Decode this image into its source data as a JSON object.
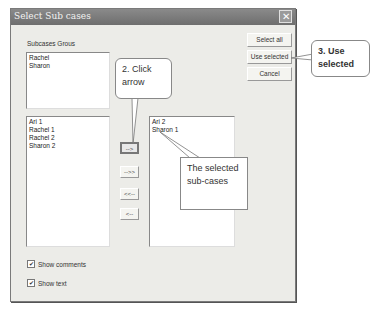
{
  "dialog": {
    "title": "Select Sub cases",
    "close_glyph": "✕",
    "group_label": "Subcases Grous",
    "groups": [
      "Rachel",
      "Sharon"
    ],
    "available": [
      "Ari 1",
      "Rachel 1",
      "Rachel 2",
      "Sharon 2"
    ],
    "selected": [
      "Ari 2",
      "Sharon 1"
    ],
    "buttons": {
      "select_all": "Select all",
      "use_selected": "Use selected",
      "cancel": "Cancel"
    },
    "arrows": {
      "move_right": "-->",
      "move_all_right": "-->>",
      "move_all_left": "<<--",
      "move_left": "<--"
    },
    "checkboxes": [
      {
        "label": "Show comments",
        "checked": true,
        "mark": "✔"
      },
      {
        "label": "Show text",
        "checked": true,
        "mark": "✔"
      }
    ]
  },
  "annotations": {
    "click_arrow": "2. Click arrow",
    "selected_subcases": "The selected sub-cases",
    "use_selected": "3. Use selected"
  }
}
